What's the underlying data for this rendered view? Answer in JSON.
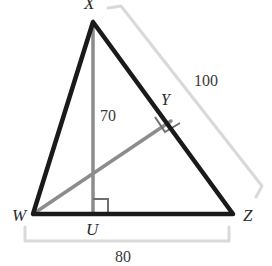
{
  "figure": {
    "type": "geometry-diagram",
    "shape": "triangle-with-altitude-and-cevian",
    "background_color": "#ffffff"
  },
  "colors": {
    "triangle_stroke": "#1a1a1a",
    "inner_line_stroke": "#808080",
    "bracket_stroke": "#d8d8d8",
    "right_angle_stroke": "#6e6e6e",
    "label_text": "#2b2b2b"
  },
  "vertices": {
    "apex": {
      "label": "X",
      "x": 93,
      "y": 22,
      "clipped": "top"
    },
    "left": {
      "label": "W",
      "x": 33,
      "y": 214
    },
    "right": {
      "label": "Z",
      "x": 233,
      "y": 214
    },
    "foot_of_altitude": {
      "label": "U",
      "x": 93,
      "y": 214
    },
    "foot_on_hypotenuse": {
      "label": "Y",
      "x": 171,
      "y": 121
    }
  },
  "measurements": {
    "altitude": {
      "value": "70",
      "describes": "XU"
    },
    "hypotenuse": {
      "value": "100",
      "describes": "XZ"
    },
    "base": {
      "value": "80",
      "describes": "WZ",
      "clipped": "bottom"
    }
  },
  "marks": {
    "right_angle_at_u": "right-angle-square",
    "right_angle_at_y": "right-angle-square-rotated"
  }
}
